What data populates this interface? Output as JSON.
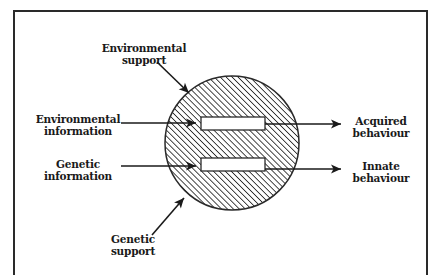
{
  "diagram": {
    "colors": {
      "stroke": "#2a2a2a",
      "background": "#ffffff",
      "box_fill": "#ffffff"
    },
    "frame": {
      "left": 14,
      "top": 11,
      "right": 427,
      "bottom": 275
    },
    "organism": {
      "shape": "hatched-circle",
      "cx": 232,
      "cy": 143,
      "r": 67
    },
    "channels": [
      {
        "id": "environmental-channel",
        "x": 201,
        "y": 117,
        "w": 64,
        "h": 13
      },
      {
        "id": "genetic-channel",
        "x": 201,
        "y": 158,
        "w": 64,
        "h": 13
      }
    ],
    "labels": {
      "environmental_support": {
        "line1": "Environmental",
        "line2": "support"
      },
      "environmental_information": {
        "line1": "Environmental",
        "line2": "information"
      },
      "genetic_information": {
        "line1": "Genetic",
        "line2": "information"
      },
      "genetic_support": {
        "line1": "Genetic",
        "line2": "support"
      },
      "acquired_behaviour": {
        "line1": "Acquired",
        "line2": "behaviour"
      },
      "innate_behaviour": {
        "line1": "Innate",
        "line2": "behaviour"
      }
    },
    "arrows": [
      {
        "name": "environmental-support-arrow",
        "from": [
          157,
          62
        ],
        "to": [
          189,
          93
        ]
      },
      {
        "name": "environmental-information-arrow",
        "from": [
          121,
          123
        ],
        "to": [
          196,
          123
        ]
      },
      {
        "name": "genetic-information-arrow",
        "from": [
          121,
          166
        ],
        "to": [
          196,
          166
        ]
      },
      {
        "name": "genetic-support-arrow",
        "from": [
          152,
          235
        ],
        "to": [
          184,
          198
        ]
      },
      {
        "name": "acquired-behaviour-arrow",
        "from": [
          265,
          124
        ],
        "to": [
          341,
          124
        ]
      },
      {
        "name": "innate-behaviour-arrow",
        "from": [
          265,
          169
        ],
        "to": [
          341,
          169
        ]
      }
    ]
  }
}
